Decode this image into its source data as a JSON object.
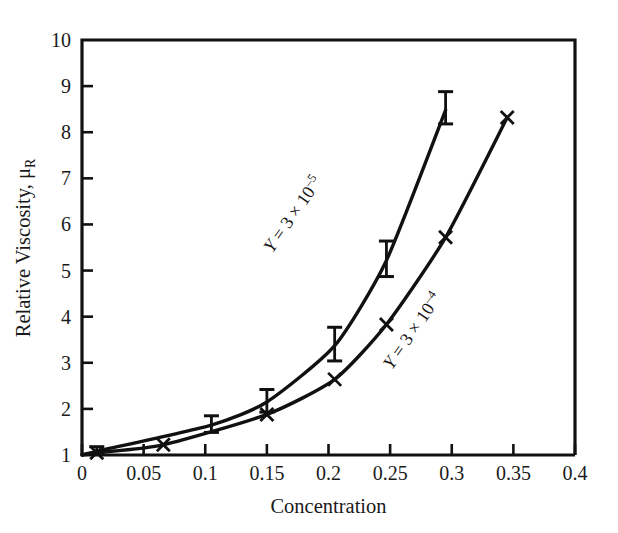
{
  "chart_data": {
    "type": "line",
    "title": "",
    "xlabel": "Concentration",
    "ylabel": "Relative Viscosity, μR",
    "ylabel_base": "Relative Viscosity, μ",
    "ylabel_sub": "R",
    "xlim": [
      0,
      0.4
    ],
    "ylim": [
      1,
      10
    ],
    "xticks": [
      0,
      0.05,
      0.1,
      0.15,
      0.2,
      0.25,
      0.3,
      0.35,
      0.4
    ],
    "xticklabels": [
      "0",
      "0.05",
      "0.1",
      "0.15",
      "0.2",
      "0.25",
      "0.3",
      "0.35",
      "0.4"
    ],
    "yticks": [
      1,
      2,
      3,
      4,
      5,
      6,
      7,
      8,
      9,
      10
    ],
    "yticklabels": [
      "1",
      "2",
      "3",
      "4",
      "5",
      "6",
      "7",
      "8",
      "9",
      "10"
    ],
    "grid": false,
    "legend_position": "inline-annotation",
    "line_color": "#111111",
    "series": [
      {
        "name": "Y = 3 × 10⁻⁵",
        "label_prefix": "Y",
        "label_equals": " = 3 × 10",
        "label_exponent": "–5",
        "marker": "errorbar",
        "annotation_x": 0.175,
        "annotation_y": 6.15,
        "annotation_rotation": -55,
        "x": [
          0.012,
          0.105,
          0.15,
          0.205,
          0.247,
          0.295
        ],
        "y": [
          1.08,
          1.65,
          2.15,
          3.37,
          5.22,
          8.48
        ],
        "yerr_low": [
          0.06,
          0.16,
          0.22,
          0.33,
          0.35,
          0.3
        ],
        "yerr_high": [
          0.1,
          0.2,
          0.27,
          0.4,
          0.42,
          0.4
        ]
      },
      {
        "name": "Y = 3 × 10⁻⁴",
        "label_prefix": "Y",
        "label_equals": " = 3 × 10",
        "label_exponent": "–4",
        "marker": "x",
        "annotation_x": 0.272,
        "annotation_y": 3.62,
        "annotation_rotation": -55,
        "x": [
          0.012,
          0.066,
          0.15,
          0.205,
          0.247,
          0.295,
          0.345
        ],
        "y": [
          1.05,
          1.22,
          1.88,
          2.64,
          3.83,
          5.72,
          8.32
        ]
      }
    ]
  },
  "figure": {
    "background": "#ffffff",
    "axis_color": "#111111"
  }
}
